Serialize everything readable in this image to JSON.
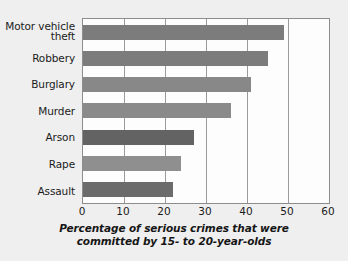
{
  "chart_data": {
    "type": "bar",
    "orientation": "horizontal",
    "title": "",
    "xlabel": "Percentage of serious crimes that were committed by 15- to 20-year-olds",
    "ylabel": "",
    "categories": [
      "Motor vehicle\ntheft",
      "Robbery",
      "Burglary",
      "Murder",
      "Arson",
      "Rape",
      "Assault"
    ],
    "values": [
      49,
      45,
      41,
      36,
      27,
      24,
      22
    ],
    "xlim": [
      0,
      60
    ],
    "ylim": null,
    "xticks": [
      0,
      10,
      20,
      30,
      40,
      50,
      60
    ],
    "xtick_labels": [
      "0",
      "10",
      "20",
      "30",
      "40",
      "50",
      "60"
    ],
    "grid": true,
    "grid_axis": "x",
    "legend": null,
    "bar_colors": [
      "#7c7c7c",
      "#7c7c7c",
      "#888888",
      "#8a8a8a",
      "#636363",
      "#8f8f8f",
      "#6b6b6b"
    ],
    "background_color": "#efefef",
    "plot_background_color": "#fdfdfd",
    "axis_color": "#8d8d8d",
    "grid_color": "#9a9a9a",
    "text_color": "#1b1b1b"
  },
  "caption": {
    "line1": "Percentage of serious crimes that were",
    "line2": "committed by 15- to 20-year-olds"
  }
}
